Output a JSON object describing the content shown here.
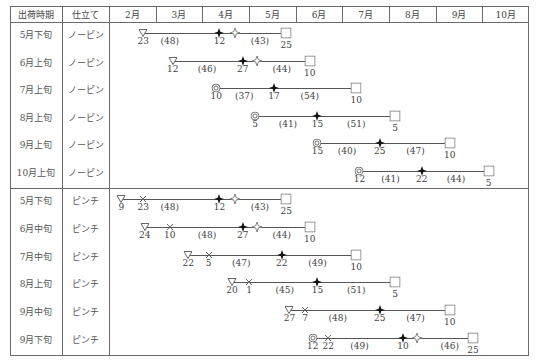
{
  "header": {
    "col_period": "出荷時期",
    "col_type": "仕立て",
    "months": [
      "2月",
      "3月",
      "4月",
      "5月",
      "6月",
      "7月",
      "8月",
      "9月",
      "10月"
    ]
  },
  "legend_symbols": {
    "sow": "open-triangle (播種)",
    "pinch": "cross (ピンチ)",
    "plant": "double-circle (定植)",
    "bud": "filled-flower (発蕾)",
    "flower": "open-flower (開花)",
    "ship": "open-square (出荷)"
  },
  "groups": [
    {
      "name": "ノーピン",
      "rows": [
        {
          "period": "5月下旬",
          "type": "ノーピン",
          "events": [
            {
              "sym": "tri",
              "m": 0,
              "d": 23,
              "label": "23"
            },
            {
              "sym": "gap",
              "m": 1,
              "d": 10,
              "label": "(48)"
            },
            {
              "sym": "bud",
              "m": 2,
              "d": 12,
              "label": "12"
            },
            {
              "sym": "flower",
              "m": 2,
              "d": 22,
              "label": ""
            },
            {
              "sym": "gap",
              "m": 3,
              "d": 8,
              "label": "(43)"
            },
            {
              "sym": "sq",
              "m": 3,
              "d": 25,
              "label": "25"
            }
          ]
        },
        {
          "period": "6月上旬",
          "type": "ノーピン",
          "events": [
            {
              "sym": "tri",
              "m": 1,
              "d": 12,
              "label": "12"
            },
            {
              "sym": "gap",
              "m": 2,
              "d": 4,
              "label": "(46)"
            },
            {
              "sym": "bud",
              "m": 2,
              "d": 27,
              "label": "27"
            },
            {
              "sym": "flower",
              "m": 3,
              "d": 6,
              "label": ""
            },
            {
              "sym": "gap",
              "m": 3,
              "d": 22,
              "label": "(44)"
            },
            {
              "sym": "sq",
              "m": 4,
              "d": 10,
              "label": "10"
            }
          ]
        },
        {
          "period": "7月上旬",
          "type": "ノーピン",
          "events": [
            {
              "sym": "dcirc",
              "m": 2,
              "d": 10,
              "label": "10"
            },
            {
              "sym": "gap",
              "m": 2,
              "d": 28,
              "label": "(37)"
            },
            {
              "sym": "bud",
              "m": 3,
              "d": 17,
              "label": "17"
            },
            {
              "sym": "gap",
              "m": 4,
              "d": 10,
              "label": "(54)"
            },
            {
              "sym": "sq",
              "m": 5,
              "d": 10,
              "label": "10"
            }
          ]
        },
        {
          "period": "8月上旬",
          "type": "ノーピン",
          "events": [
            {
              "sym": "dcirc",
              "m": 3,
              "d": 5,
              "label": "5"
            },
            {
              "sym": "gap",
              "m": 3,
              "d": 26,
              "label": "(41)"
            },
            {
              "sym": "bud",
              "m": 4,
              "d": 15,
              "label": "15"
            },
            {
              "sym": "gap",
              "m": 5,
              "d": 10,
              "label": "(51)"
            },
            {
              "sym": "sq",
              "m": 6,
              "d": 5,
              "label": "5"
            }
          ]
        },
        {
          "period": "9月上旬",
          "type": "ノーピン",
          "events": [
            {
              "sym": "dcirc",
              "m": 4,
              "d": 15,
              "label": "15"
            },
            {
              "sym": "gap",
              "m": 5,
              "d": 4,
              "label": "(40)"
            },
            {
              "sym": "bud",
              "m": 5,
              "d": 25,
              "label": "25"
            },
            {
              "sym": "gap",
              "m": 6,
              "d": 18,
              "label": "(47)"
            },
            {
              "sym": "sq",
              "m": 7,
              "d": 10,
              "label": "10"
            }
          ]
        },
        {
          "period": "10月上旬",
          "type": "ノーピン",
          "events": [
            {
              "sym": "dcirc",
              "m": 5,
              "d": 12,
              "label": "12"
            },
            {
              "sym": "gap",
              "m": 6,
              "d": 2,
              "label": "(41)"
            },
            {
              "sym": "bud",
              "m": 6,
              "d": 22,
              "label": "22"
            },
            {
              "sym": "gap",
              "m": 7,
              "d": 14,
              "label": "(44)"
            },
            {
              "sym": "sq",
              "m": 8,
              "d": 5,
              "label": "5"
            }
          ]
        }
      ]
    },
    {
      "name": "ピンチ",
      "rows": [
        {
          "period": "5月下旬",
          "type": "ピンチ",
          "events": [
            {
              "sym": "tri",
              "m": 0,
              "d": 9,
              "label": "9"
            },
            {
              "sym": "x",
              "m": 0,
              "d": 23,
              "label": "23"
            },
            {
              "sym": "gap",
              "m": 1,
              "d": 10,
              "label": "(48)"
            },
            {
              "sym": "bud",
              "m": 2,
              "d": 12,
              "label": "12"
            },
            {
              "sym": "flower",
              "m": 2,
              "d": 22,
              "label": ""
            },
            {
              "sym": "gap",
              "m": 3,
              "d": 8,
              "label": "(43)"
            },
            {
              "sym": "sq",
              "m": 3,
              "d": 25,
              "label": "25"
            }
          ]
        },
        {
          "period": "6月中旬",
          "type": "ピンチ",
          "events": [
            {
              "sym": "tri",
              "m": 0,
              "d": 24,
              "label": "24"
            },
            {
              "sym": "x",
              "m": 1,
              "d": 10,
              "label": "10"
            },
            {
              "sym": "gap",
              "m": 2,
              "d": 4,
              "label": "(48)"
            },
            {
              "sym": "bud",
              "m": 2,
              "d": 27,
              "label": "27"
            },
            {
              "sym": "flower",
              "m": 3,
              "d": 6,
              "label": ""
            },
            {
              "sym": "gap",
              "m": 3,
              "d": 22,
              "label": "(44)"
            },
            {
              "sym": "sq",
              "m": 4,
              "d": 10,
              "label": "10"
            }
          ]
        },
        {
          "period": "7月中旬",
          "type": "ピンチ",
          "events": [
            {
              "sym": "tri",
              "m": 1,
              "d": 22,
              "label": "22"
            },
            {
              "sym": "x",
              "m": 2,
              "d": 5,
              "label": "5"
            },
            {
              "sym": "gap",
              "m": 2,
              "d": 26,
              "label": "(47)"
            },
            {
              "sym": "bud",
              "m": 3,
              "d": 22,
              "label": "22"
            },
            {
              "sym": "gap",
              "m": 4,
              "d": 15,
              "label": "(49)"
            },
            {
              "sym": "sq",
              "m": 5,
              "d": 10,
              "label": "10"
            }
          ]
        },
        {
          "period": "8月上旬",
          "type": "ピンチ",
          "events": [
            {
              "sym": "tri",
              "m": 2,
              "d": 20,
              "label": "20"
            },
            {
              "sym": "x",
              "m": 3,
              "d": 1,
              "label": "1"
            },
            {
              "sym": "gap",
              "m": 3,
              "d": 24,
              "label": "(45)"
            },
            {
              "sym": "bud",
              "m": 4,
              "d": 15,
              "label": "15"
            },
            {
              "sym": "gap",
              "m": 5,
              "d": 10,
              "label": "(51)"
            },
            {
              "sym": "sq",
              "m": 6,
              "d": 5,
              "label": "5"
            }
          ]
        },
        {
          "period": "9月中旬",
          "type": "ピンチ",
          "events": [
            {
              "sym": "tri",
              "m": 3,
              "d": 27,
              "label": "27"
            },
            {
              "sym": "x",
              "m": 4,
              "d": 7,
              "label": "7"
            },
            {
              "sym": "gap",
              "m": 4,
              "d": 28,
              "label": "(48)"
            },
            {
              "sym": "bud",
              "m": 5,
              "d": 25,
              "label": "25"
            },
            {
              "sym": "gap",
              "m": 6,
              "d": 18,
              "label": "(47)"
            },
            {
              "sym": "sq",
              "m": 7,
              "d": 10,
              "label": "10"
            }
          ]
        },
        {
          "period": "9月下旬",
          "type": "ピンチ",
          "events": [
            {
              "sym": "dcirc",
              "m": 4,
              "d": 12,
              "label": "12"
            },
            {
              "sym": "x",
              "m": 4,
              "d": 22,
              "label": "22"
            },
            {
              "sym": "gap",
              "m": 5,
              "d": 12,
              "label": "(49)"
            },
            {
              "sym": "bud",
              "m": 6,
              "d": 10,
              "label": "10"
            },
            {
              "sym": "flower",
              "m": 6,
              "d": 19,
              "label": ""
            },
            {
              "sym": "gap",
              "m": 7,
              "d": 10,
              "label": "(46)"
            },
            {
              "sym": "sq",
              "m": 7,
              "d": 25,
              "label": "25"
            }
          ]
        }
      ]
    }
  ]
}
